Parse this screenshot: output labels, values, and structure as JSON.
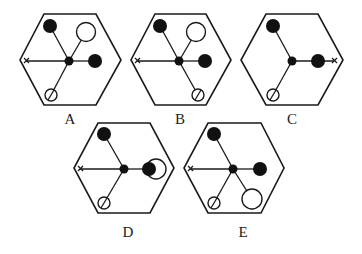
{
  "figure": {
    "type": "multiple-choice-options",
    "options": [
      {
        "label": "A",
        "components": [
          "filled-circle-top-left",
          "open-circle-top-right",
          "x-mark-left",
          "filled-circle-right",
          "slashed-circle-bottom-left",
          "center-dot"
        ]
      },
      {
        "label": "B",
        "components": [
          "filled-circle-top-left",
          "open-circle-top-right",
          "x-mark-left",
          "filled-circle-right",
          "slashed-circle-bottom-right",
          "center-dot"
        ]
      },
      {
        "label": "C",
        "components": [
          "filled-circle-top-left",
          "filled-circle-right",
          "x-mark-right",
          "slashed-circle-bottom-left",
          "center-dot"
        ]
      },
      {
        "label": "D",
        "components": [
          "filled-circle-top-left",
          "x-mark-left",
          "filled-circle-with-open-circle-right",
          "slashed-circle-bottom-left",
          "center-dot"
        ]
      },
      {
        "label": "E",
        "components": [
          "filled-circle-top-left",
          "x-mark-left",
          "filled-circle-right",
          "slashed-circle-bottom-left",
          "open-circle-bottom-right",
          "center-dot"
        ]
      }
    ]
  },
  "labels": {
    "a": "A",
    "b": "B",
    "c": "C",
    "d": "D",
    "e": "E"
  }
}
